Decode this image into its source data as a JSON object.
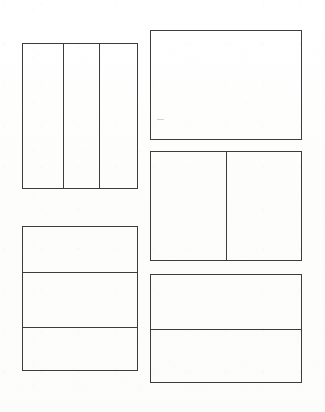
{
  "sheet": {
    "title": "Blank Panel Layout Sheet",
    "background_color": "#ffffff",
    "line_color": "#3c3c3c",
    "width_px": 325,
    "height_px": 412
  },
  "panels": [
    {
      "id": "panel-1",
      "name": "top-left-three-column-panel",
      "label": "",
      "x": 22,
      "y": 43,
      "width": 116,
      "height": 146,
      "split": "vertical",
      "cell_count": 3,
      "dividers": [
        40,
        76
      ],
      "cells": [
        {
          "id": "panel-1-cell-1",
          "label": "",
          "x": 0,
          "width": 40
        },
        {
          "id": "panel-1-cell-2",
          "label": "",
          "x": 40,
          "width": 36
        },
        {
          "id": "panel-1-cell-3",
          "label": "",
          "x": 76,
          "width": 40
        }
      ]
    },
    {
      "id": "panel-2",
      "name": "top-right-single-panel",
      "label": "",
      "x": 150,
      "y": 30,
      "width": 152,
      "height": 110,
      "split": "none",
      "cell_count": 1,
      "dividers": [],
      "cells": [
        {
          "id": "panel-2-cell-1",
          "label": "",
          "x": 0,
          "width": 152
        }
      ]
    },
    {
      "id": "panel-3",
      "name": "middle-right-two-column-panel",
      "label": "",
      "x": 150,
      "y": 151,
      "width": 152,
      "height": 110,
      "split": "vertical",
      "cell_count": 2,
      "dividers": [
        75
      ],
      "cells": [
        {
          "id": "panel-3-cell-1",
          "label": "",
          "x": 0,
          "width": 75
        },
        {
          "id": "panel-3-cell-2",
          "label": "",
          "x": 75,
          "width": 77
        }
      ]
    },
    {
      "id": "panel-4",
      "name": "bottom-left-three-row-panel",
      "label": "",
      "x": 22,
      "y": 226,
      "width": 116,
      "height": 145,
      "split": "horizontal",
      "cell_count": 3,
      "dividers": [
        45,
        100
      ],
      "cells": [
        {
          "id": "panel-4-cell-1",
          "label": "",
          "y": 0,
          "height": 45
        },
        {
          "id": "panel-4-cell-2",
          "label": "",
          "y": 45,
          "height": 55
        },
        {
          "id": "panel-4-cell-3",
          "label": "",
          "y": 100,
          "height": 45
        }
      ]
    },
    {
      "id": "panel-5",
      "name": "bottom-right-two-row-panel",
      "label": "",
      "x": 150,
      "y": 274,
      "width": 152,
      "height": 109,
      "split": "horizontal",
      "cell_count": 2,
      "dividers": [
        54
      ],
      "cells": [
        {
          "id": "panel-5-cell-1",
          "label": "",
          "y": 0,
          "height": 54
        },
        {
          "id": "panel-5-cell-2",
          "label": "",
          "y": 54,
          "height": 55
        }
      ]
    }
  ]
}
